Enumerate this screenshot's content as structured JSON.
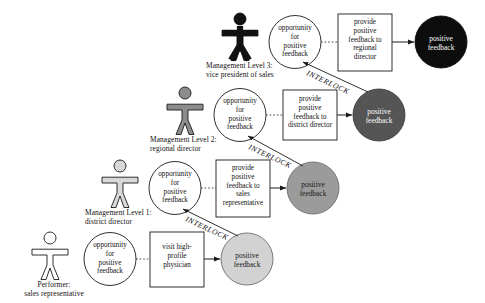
{
  "diagram": {
    "colors": {
      "background": "#ffffff",
      "stroke": "#1a1a1a",
      "level3_actor_fill": "#111111",
      "level2_actor_fill": "#8c8c8c",
      "level1_actor_fill": "#d8d8d8",
      "performer_actor_fill": "#ffffff",
      "level3_result_fill": "#0d0d0d",
      "level2_result_fill": "#555555",
      "level1_result_fill": "#9b9b9b",
      "performer_result_fill": "#d2d2d2",
      "opportunity_fill": "#ffffff",
      "action_box_fill": "#ffffff"
    },
    "interlock_label": "INTERLOCK",
    "rows": [
      {
        "id": "level-3",
        "actor_name": "actor-figure-level-3",
        "actor_label": "Management  Level 3:\nvice president of sales",
        "opportunity_label": "opportunity\nfor\npositive\nfeedback",
        "action_label": "provide\npositive\nfeedback to\nregional\ndirector",
        "result_label": "positive\nfeedback",
        "actor_fill": "#111111",
        "result_fill": "#0d0d0d",
        "result_text_on_dark": true
      },
      {
        "id": "level-2",
        "actor_name": "actor-figure-level-2",
        "actor_label": "Management  Level 2:\nregional  director",
        "opportunity_label": "opportunity\nfor\npositive\nfeedback",
        "action_label": "provide\npositive\nfeedback to\ndistrict director",
        "result_label": "positive\nfeedback",
        "actor_fill": "#8c8c8c",
        "result_fill": "#555555",
        "result_text_on_dark": true
      },
      {
        "id": "level-1",
        "actor_name": "actor-figure-level-1",
        "actor_label": "Management  Level 1:\ndistrict director",
        "opportunity_label": "opportunity\nfor\npositive\nfeedback",
        "action_label": "provide\npositive\nfeedback to\nsales\nrepresentative",
        "result_label": "positive\nfeedback",
        "actor_fill": "#d8d8d8",
        "result_fill": "#9b9b9b",
        "result_text_on_dark": false
      },
      {
        "id": "performer",
        "actor_name": "actor-figure-performer",
        "actor_label": "Performer:\nsales representative",
        "opportunity_label": "opportunity\nfor\npositive\nfeedback",
        "action_label": "visit high-\nprofile\nphysician",
        "result_label": "positive\nfeedback",
        "actor_fill": "#ffffff",
        "result_fill": "#d2d2d2",
        "result_text_on_dark": false
      }
    ]
  }
}
